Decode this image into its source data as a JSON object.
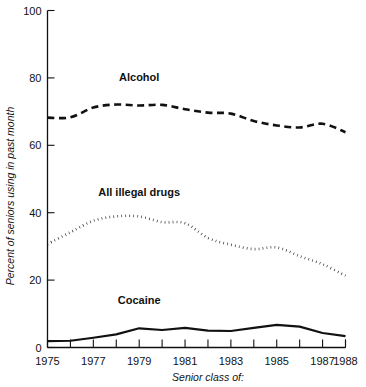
{
  "chart_data": {
    "type": "line",
    "title": "",
    "xlabel": "Senior class of:",
    "ylabel": "Percent of seniors using in past month",
    "x": [
      1975,
      1976,
      1977,
      1978,
      1979,
      1980,
      1981,
      1982,
      1983,
      1984,
      1985,
      1986,
      1987,
      1988
    ],
    "xtick_labels": [
      "1975",
      "1977",
      "1979",
      "1981",
      "1983",
      "1985",
      "1987",
      "1988"
    ],
    "xtick_values": [
      1975,
      1977,
      1979,
      1981,
      1983,
      1985,
      1987,
      1988
    ],
    "ytick_labels": [
      "0",
      "20",
      "40",
      "60",
      "80",
      "100"
    ],
    "ytick_values": [
      0,
      20,
      40,
      60,
      80,
      100
    ],
    "xlim": [
      1975,
      1988
    ],
    "ylim": [
      0,
      100
    ],
    "grid": false,
    "legend_position": "inline-annotations",
    "series": [
      {
        "name": "Alcohol",
        "label": "Alcohol",
        "style": "dashed",
        "color": "#111111",
        "values": [
          68.2,
          68.3,
          71.2,
          72.1,
          71.8,
          72.0,
          70.7,
          69.7,
          69.4,
          67.2,
          65.9,
          65.3,
          66.4,
          63.9
        ]
      },
      {
        "name": "All illegal drugs",
        "label": "All illegal drugs",
        "style": "dotted",
        "color": "#111111",
        "values": [
          30.7,
          34.2,
          37.6,
          38.9,
          38.9,
          37.2,
          36.9,
          32.5,
          30.5,
          29.2,
          29.7,
          27.1,
          24.7,
          21.3
        ]
      },
      {
        "name": "Cocaine",
        "label": "Cocaine",
        "style": "solid",
        "color": "#111111",
        "values": [
          1.9,
          2.0,
          2.9,
          3.9,
          5.7,
          5.2,
          5.8,
          5.0,
          4.9,
          5.8,
          6.7,
          6.2,
          4.3,
          3.4
        ]
      }
    ],
    "annotations": [
      {
        "text": "Alcohol",
        "x": 1979,
        "y": 79
      },
      {
        "text": "All illegal drugs",
        "x": 1979,
        "y": 45
      },
      {
        "text": "Cocaine",
        "x": 1979,
        "y": 13
      }
    ]
  }
}
